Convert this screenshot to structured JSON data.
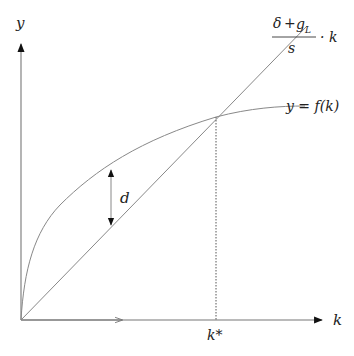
{
  "diagram": {
    "axes": {
      "y_label": "y",
      "x_label": "k"
    },
    "curves": {
      "production": {
        "label": "y = f(k)"
      },
      "break_even": {
        "numerator_delta": "δ",
        "numerator_plus": "+",
        "numerator_g": "g",
        "numerator_sub": "L",
        "denominator": "s",
        "times_k": "· k"
      }
    },
    "annotations": {
      "gap_label": "d",
      "steady_state_label": "k*"
    }
  }
}
